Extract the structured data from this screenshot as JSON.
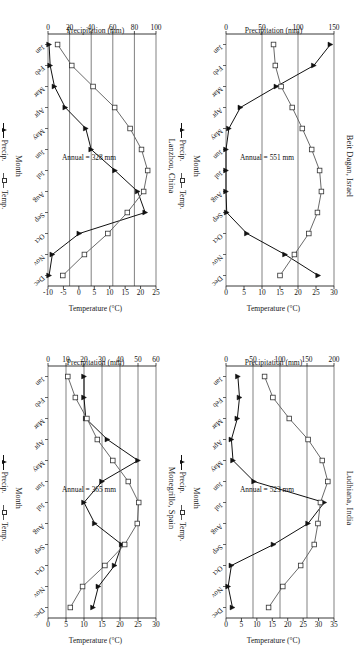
{
  "figure": {
    "layout": "2x2 grid of climate diagrams, each rotated 90 degrees",
    "panel_order": [
      "lanzhou",
      "beit_dagan",
      "monegrillo",
      "ludhiana"
    ]
  },
  "common": {
    "xlabel": "Month",
    "ylabel_left": "Precipitation (mm)",
    "ylabel_right": "Temperature (°C)",
    "legend": [
      {
        "label": "Precip.",
        "marker": "filled-triangle-line",
        "color": "#111111"
      },
      {
        "label": "Temp.",
        "marker": "open-square-line",
        "color": "#555555"
      }
    ],
    "months": [
      "Jan",
      "Feb",
      "Mar",
      "Apr",
      "May",
      "Jun",
      "Jul",
      "Aug",
      "Sep",
      "Oct",
      "Nov",
      "Dec"
    ]
  },
  "chart_data": [
    {
      "id": "lanzhou",
      "type": "line",
      "title": "Lanzhou, China",
      "annotation": "Annual = 328 mm",
      "xlabel": "Month",
      "ylabel": "Precipitation (mm)",
      "ylabel2": "Temperature (°C)",
      "categories": [
        "Jan",
        "Feb",
        "Mar",
        "Apr",
        "May",
        "Jun",
        "Jul",
        "Aug",
        "Sep",
        "Oct",
        "Nov",
        "Dec"
      ],
      "yticks_left": [
        0,
        20,
        40,
        60,
        80,
        100
      ],
      "ylim_left": [
        0,
        100
      ],
      "yticks_right": [
        -10,
        -5,
        0,
        5,
        10,
        15,
        20,
        25
      ],
      "ylim_right": [
        -10,
        25
      ],
      "grid": true,
      "legend_position": "bottom",
      "series": [
        {
          "name": "Precip.",
          "axis": "left",
          "unit": "mm",
          "values": [
            1,
            2,
            6,
            16,
            35,
            40,
            62,
            83,
            90,
            29,
            4,
            1
          ]
        },
        {
          "name": "Temp.",
          "axis": "right",
          "unit": "°C",
          "values": [
            -6.9,
            -2.3,
            4.6,
            11.6,
            16.6,
            20.3,
            22.3,
            21.0,
            15.7,
            9.4,
            1.8,
            -5.2
          ]
        }
      ]
    },
    {
      "id": "beit_dagan",
      "type": "line",
      "title": "Beit Dagan, Israel",
      "annotation": "Annual = 551 mm",
      "xlabel": "Month",
      "ylabel": "Precipitation (mm)",
      "ylabel2": "Temperature (°C)",
      "categories": [
        "Jan",
        "Feb",
        "Mar",
        "Apr",
        "May",
        "Jun",
        "Jul",
        "Aug",
        "Sep",
        "Oct",
        "Nov",
        "Dec"
      ],
      "yticks_left": [
        0,
        50,
        100,
        150
      ],
      "ylim_left": [
        0,
        150
      ],
      "yticks_right": [
        0,
        5,
        10,
        15,
        20,
        25,
        30
      ],
      "ylim_right": [
        0,
        30
      ],
      "grid": true,
      "legend_position": "bottom",
      "series": [
        {
          "name": "Precip.",
          "axis": "left",
          "unit": "mm",
          "values": [
            145,
            122,
            70,
            20,
            4,
            0,
            0,
            0,
            1,
            29,
            82,
            128
          ]
        },
        {
          "name": "Temp.",
          "axis": "right",
          "unit": "°C",
          "values": [
            13.2,
            13.7,
            15.3,
            18.4,
            21.2,
            23.8,
            26.0,
            26.5,
            25.4,
            23.0,
            19.0,
            15.0
          ]
        }
      ]
    },
    {
      "id": "monegrillo",
      "type": "line",
      "title": "Monegrillo, Spain",
      "annotation": "Annual = 365 mm",
      "xlabel": "Month",
      "ylabel": "Precipitation (mm)",
      "ylabel2": "Temperature (°C)",
      "categories": [
        "Jan",
        "Feb",
        "Mar",
        "Apr",
        "May",
        "Jun",
        "Jul",
        "Aug",
        "Sep",
        "Oct",
        "Nov",
        "Dec"
      ],
      "yticks_left": [
        0,
        10,
        20,
        30,
        40,
        50,
        60
      ],
      "ylim_left": [
        0,
        60
      ],
      "yticks_right": [
        0,
        5,
        10,
        15,
        20,
        25,
        30
      ],
      "ylim_right": [
        0,
        30
      ],
      "grid": true,
      "legend_position": "bottom",
      "series": [
        {
          "name": "Precip.",
          "axis": "left",
          "unit": "mm",
          "values": [
            20,
            20,
            21,
            33,
            50,
            30,
            20,
            26,
            41,
            37,
            28,
            25
          ]
        },
        {
          "name": "Temp.",
          "axis": "right",
          "unit": "°C",
          "values": [
            5.5,
            7.6,
            10.8,
            13.7,
            18.0,
            22.3,
            25.2,
            24.8,
            21.3,
            15.8,
            9.6,
            6.2
          ]
        }
      ]
    },
    {
      "id": "ludhiana",
      "type": "line",
      "title": "Ludhiana, India",
      "annotation": "Annual = 523 mm",
      "xlabel": "Month",
      "ylabel": "Precipitation (mm)",
      "ylabel2": "Temperature (°C)",
      "categories": [
        "Jan",
        "Feb",
        "Mar",
        "Apr",
        "May",
        "Jun",
        "Jul",
        "Aug",
        "Sep",
        "Oct",
        "Nov",
        "Dec"
      ],
      "yticks_left": [
        0,
        50,
        100,
        150,
        200
      ],
      "ylim_left": [
        0,
        200
      ],
      "yticks_right": [
        0,
        5,
        10,
        15,
        20,
        25,
        30,
        35
      ],
      "ylim_right": [
        0,
        35
      ],
      "grid": true,
      "legend_position": "bottom",
      "series": [
        {
          "name": "Precip.",
          "axis": "left",
          "unit": "mm",
          "values": [
            22,
            25,
            21,
            10,
            13,
            52,
            182,
            152,
            88,
            10,
            4,
            12
          ]
        },
        {
          "name": "Temp.",
          "axis": "right",
          "unit": "°C",
          "values": [
            12.5,
            15.2,
            20.5,
            26.6,
            31.2,
            33.0,
            30.6,
            29.8,
            28.6,
            24.2,
            18.4,
            13.8
          ]
        }
      ]
    }
  ]
}
